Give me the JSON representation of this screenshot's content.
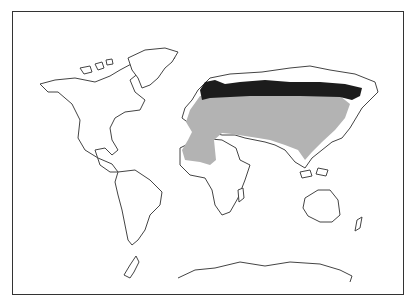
{
  "map": {
    "type": "world distribution map",
    "colors": {
      "background": "#ffffff",
      "outline": "#444444",
      "range_light": "#b3b3b3",
      "range_dark": "#1c1c1c"
    },
    "regions": [
      {
        "name": "northern-eurasia",
        "shade": "dark"
      },
      {
        "name": "temperate-eurasia-north-africa",
        "shade": "light"
      }
    ]
  }
}
